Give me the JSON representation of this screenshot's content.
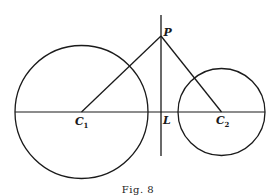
{
  "figure": {
    "caption": "Fig. 8",
    "labels": {
      "P": "P",
      "L": "L",
      "C1_main": "C",
      "C1_sub": "1",
      "C2_main": "C",
      "C2_sub": "2"
    },
    "elements": [
      "circle C1",
      "circle C2",
      "line of centers C1C2",
      "radical axis through L",
      "segment PC1",
      "segment PC2"
    ]
  }
}
